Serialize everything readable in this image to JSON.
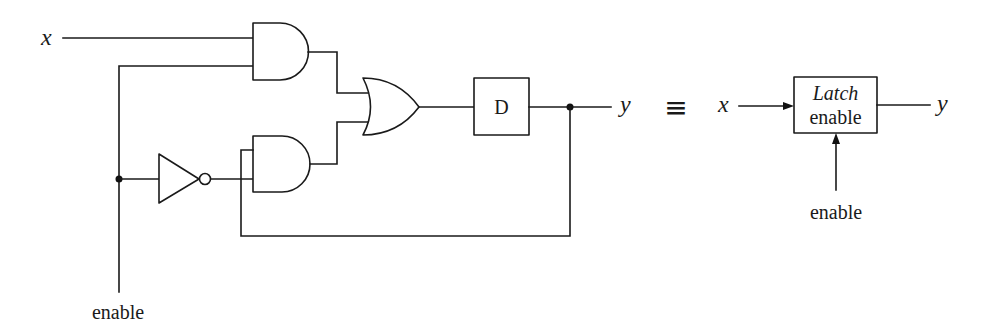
{
  "diagram": {
    "type": "logic-circuit",
    "left_circuit": {
      "input_x_label": "x",
      "enable_label": "enable",
      "d_box_label": "D",
      "output_y_label": "y",
      "gates": [
        "AND (x, enable)",
        "NOT (enable)",
        "AND (NOT enable, y feedback)",
        "OR",
        "D delay"
      ]
    },
    "equivalence_symbol": "≡",
    "right_block": {
      "input_x_label": "x",
      "box_title": "Latch",
      "box_subtitle": "enable",
      "output_y_label": "y",
      "enable_label": "enable"
    }
  }
}
